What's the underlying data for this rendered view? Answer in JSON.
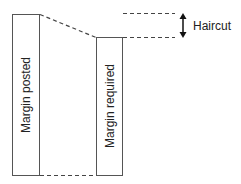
{
  "diagram": {
    "left_box_label": "Margin posted",
    "right_box_label": "Margin required",
    "haircut_label": "Haircut",
    "colors": {
      "stroke": "#444444",
      "text": "#222222",
      "background": "#ffffff"
    }
  }
}
